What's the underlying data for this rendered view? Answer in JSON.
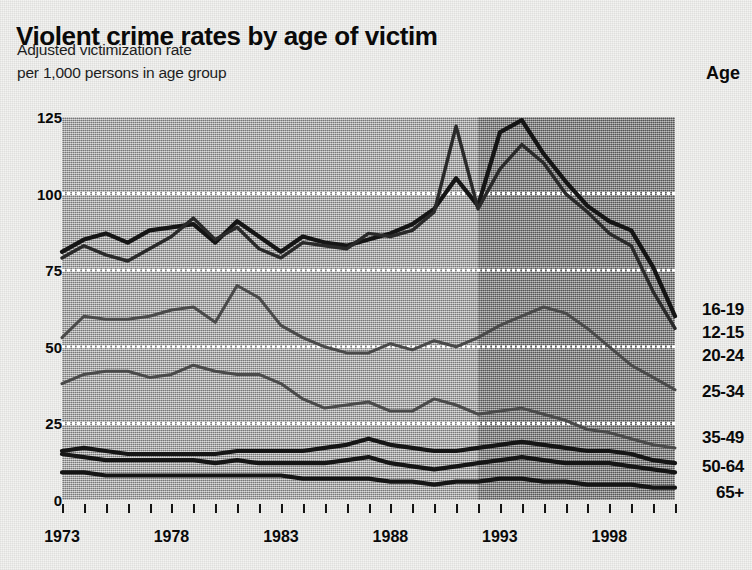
{
  "header": {
    "title": "Violent crime rates by age of victim",
    "subtitle_line1": "Adjusted victimization rate",
    "subtitle_line2": "per 1,000 persons in age group",
    "legend_header": "Age"
  },
  "colors": {
    "paper": "#f3f3f1",
    "plot_background": "#a6a6a6",
    "plot_background_shaded": "#888888",
    "gridline": "#ffffff",
    "ink": "#0a0a0a"
  },
  "chart_data": {
    "type": "line",
    "title": "Violent crime rates by age of victim",
    "subtitle": "Adjusted victimization rate per 1,000 persons in age group",
    "xlabel": "",
    "ylabel": "Adjusted victimization rate per 1,000 persons in age group",
    "ylim": [
      0,
      125
    ],
    "xlim": [
      1973,
      2001
    ],
    "yticks": [
      0,
      25,
      50,
      75,
      100,
      125
    ],
    "ytick_labels": [
      "0",
      "25",
      "50",
      "75",
      "100",
      "125"
    ],
    "xticks": [
      1973,
      1978,
      1983,
      1988,
      1993,
      1998
    ],
    "xtick_labels": [
      "1973",
      "1978",
      "1983",
      "1988",
      "1993",
      "1998"
    ],
    "minor_xticks_every": 1,
    "grid": "horizontal-white-dotted",
    "legend_position": "right-of-plot-line-ends",
    "shaded_region": {
      "from": 1992,
      "to": 2001,
      "note": "darker background band"
    },
    "x": [
      1973,
      1974,
      1975,
      1976,
      1977,
      1978,
      1979,
      1980,
      1981,
      1982,
      1983,
      1984,
      1985,
      1986,
      1987,
      1988,
      1989,
      1990,
      1991,
      1992,
      1993,
      1994,
      1995,
      1996,
      1997,
      1998,
      1999,
      2000,
      2001
    ],
    "series": [
      {
        "name": "16-19",
        "values": [
          81,
          85,
          87,
          84,
          88,
          89,
          90,
          84,
          91,
          86,
          81,
          86,
          84,
          83,
          85,
          87,
          90,
          95,
          105,
          96,
          120,
          124,
          113,
          104,
          96,
          91,
          88,
          76,
          60
        ]
      },
      {
        "name": "12-15",
        "values": [
          79,
          83,
          80,
          78,
          82,
          86,
          92,
          85,
          89,
          82,
          79,
          84,
          83,
          82,
          87,
          86,
          88,
          94,
          122,
          95,
          108,
          116,
          110,
          100,
          94,
          87,
          83,
          68,
          56
        ]
      },
      {
        "name": "20-24",
        "values": [
          53,
          60,
          59,
          59,
          60,
          62,
          63,
          58,
          70,
          66,
          57,
          53,
          50,
          48,
          48,
          51,
          49,
          52,
          50,
          53,
          57,
          60,
          63,
          61,
          56,
          50,
          44,
          40,
          36
        ]
      },
      {
        "name": "25-34",
        "values": [
          38,
          41,
          42,
          42,
          40,
          41,
          44,
          42,
          41,
          41,
          38,
          33,
          30,
          31,
          32,
          29,
          29,
          33,
          31,
          28,
          29,
          30,
          28,
          26,
          23,
          22,
          20,
          18,
          17
        ]
      },
      {
        "name": "35-49",
        "values": [
          16,
          17,
          16,
          15,
          15,
          15,
          15,
          15,
          16,
          16,
          16,
          16,
          17,
          18,
          20,
          18,
          17,
          16,
          16,
          17,
          18,
          19,
          18,
          17,
          16,
          16,
          15,
          13,
          12
        ]
      },
      {
        "name": "50-64",
        "values": [
          15,
          14,
          13,
          13,
          13,
          13,
          13,
          12,
          13,
          12,
          12,
          12,
          12,
          13,
          14,
          12,
          11,
          10,
          11,
          12,
          13,
          14,
          13,
          12,
          12,
          12,
          11,
          10,
          9
        ]
      },
      {
        "name": "65+",
        "values": [
          9,
          9,
          8,
          8,
          8,
          8,
          8,
          8,
          8,
          8,
          8,
          7,
          7,
          7,
          7,
          6,
          6,
          5,
          6,
          6,
          7,
          7,
          6,
          6,
          5,
          5,
          5,
          4,
          4
        ]
      }
    ]
  },
  "legend": [
    {
      "label": "16-19",
      "top": 300
    },
    {
      "label": "12-15",
      "top": 323
    },
    {
      "label": "20-24",
      "top": 346
    },
    {
      "label": "25-34",
      "top": 382
    },
    {
      "label": "35-49",
      "top": 428
    },
    {
      "label": "50-64",
      "top": 457
    },
    {
      "label": "65+",
      "top": 483
    }
  ]
}
